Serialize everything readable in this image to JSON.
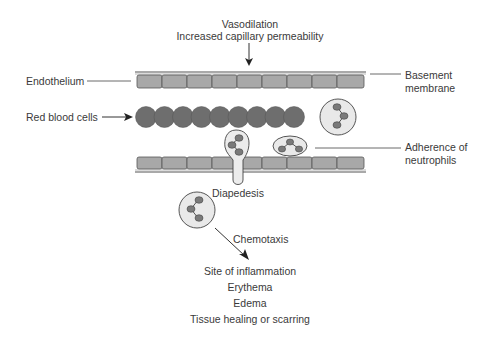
{
  "diagram": {
    "title_lines": [
      "Vasodilation",
      "Increased capillary permeability"
    ],
    "labels": {
      "endothelium": "Endothelium",
      "basement_membrane_1": "Basement",
      "basement_membrane_2": "membrane",
      "red_blood_cells": "Red blood cells",
      "adherence_1": "Adherence of",
      "adherence_2": "neutrophils",
      "diapedesis": "Diapedesis",
      "chemotaxis": "Chemotaxis"
    },
    "outcomes": [
      "Site of inflammation",
      "Erythema",
      "Edema",
      "Tissue healing or scarring"
    ],
    "counts": {
      "endothelial_cells_per_layer": 9,
      "red_blood_cells": 9
    },
    "colors": {
      "cell_fill": "#a8a8a8",
      "rbc_fill": "#6e6e6e",
      "neutrophil_fill": "#e9e9e9",
      "nucleus_fill": "#7a7a7a",
      "line": "#444444"
    }
  }
}
